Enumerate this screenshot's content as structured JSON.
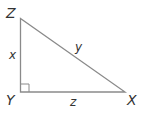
{
  "diagram": {
    "type": "right-triangle",
    "vertices": {
      "Z": "Z",
      "Y": "Y",
      "X": "X"
    },
    "sides": {
      "ZY": "x",
      "ZX": "y",
      "YX": "z"
    },
    "right_angle_at": "Y",
    "stroke_color": "#8a8a8a"
  }
}
